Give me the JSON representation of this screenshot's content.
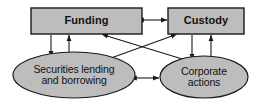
{
  "diagram": {
    "type": "block-flow-diagram",
    "width": 260,
    "height": 104,
    "colors": {
      "node_fill": "#bdbdbd",
      "node_stroke": "#1a1a1a",
      "arrow": "#1a1a1a",
      "text": "#111111",
      "background": "#ffffff"
    },
    "nodes": [
      {
        "id": "funding",
        "label": "Funding",
        "shape": "rectangle",
        "x": 31,
        "y": 8,
        "width": 111,
        "height": 26
      },
      {
        "id": "custody",
        "label": "Custody",
        "shape": "rectangle",
        "x": 168,
        "y": 8,
        "width": 76,
        "height": 26
      },
      {
        "id": "securities_lending",
        "label": "Securities lending and borrowing",
        "label_line1": "Securities lending",
        "label_line2": "and borrowing",
        "shape": "ellipse",
        "x": 13,
        "y": 52,
        "width": 122,
        "height": 46
      },
      {
        "id": "corporate_actions",
        "label": "Corporate actions",
        "label_line1": "Corporate",
        "label_line2": "actions",
        "shape": "ellipse",
        "x": 160,
        "y": 56,
        "width": 88,
        "height": 42
      }
    ],
    "edges": [
      {
        "id": "funding-custody",
        "from": "funding",
        "to": "custody",
        "direction": "bidirectional"
      },
      {
        "id": "securities_lending-corporate_actions",
        "from": "securities_lending",
        "to": "corporate_actions",
        "direction": "bidirectional"
      },
      {
        "id": "funding-securities_lending-down",
        "from": "funding",
        "to": "securities_lending",
        "direction": "down"
      },
      {
        "id": "securities_lending-funding-up",
        "from": "securities_lending",
        "to": "funding",
        "direction": "up"
      },
      {
        "id": "custody-corporate_actions-down",
        "from": "custody",
        "to": "corporate_actions",
        "direction": "down"
      },
      {
        "id": "corporate_actions-custody-up",
        "from": "corporate_actions",
        "to": "custody",
        "direction": "up"
      },
      {
        "id": "funding-corporate_actions",
        "from": "funding",
        "to": "corporate_actions",
        "direction": "bidirectional"
      },
      {
        "id": "custody-securities_lending",
        "from": "custody",
        "to": "securities_lending",
        "direction": "bidirectional"
      }
    ]
  }
}
